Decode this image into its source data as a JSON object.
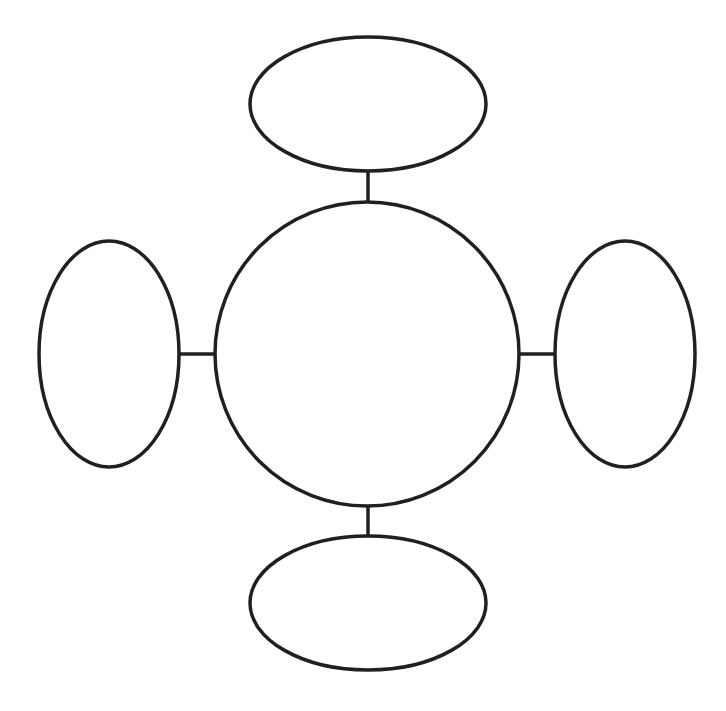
{
  "diagram": {
    "type": "bubble-map",
    "width": 726,
    "height": 711,
    "background": "#ffffff",
    "stroke_color": "#231f20",
    "stroke_width": 3.5,
    "center": {
      "label": "",
      "cx": 367,
      "cy": 354,
      "r": 152
    },
    "nodes": [
      {
        "id": "top",
        "label": "",
        "cx": 368,
        "cy": 104,
        "rx": 118,
        "ry": 67
      },
      {
        "id": "bottom",
        "label": "",
        "cx": 368,
        "cy": 603,
        "rx": 118,
        "ry": 67
      },
      {
        "id": "left",
        "label": "",
        "cx": 109,
        "cy": 354,
        "rx": 70,
        "ry": 113
      },
      {
        "id": "right",
        "label": "",
        "cx": 625,
        "cy": 354,
        "rx": 70,
        "ry": 113
      }
    ],
    "connectors": [
      {
        "id": "top",
        "x1": 368,
        "y1": 171,
        "x2": 368,
        "y2": 202
      },
      {
        "id": "bottom",
        "x1": 368,
        "y1": 506,
        "x2": 368,
        "y2": 536
      },
      {
        "id": "left",
        "x1": 179,
        "y1": 354,
        "x2": 215,
        "y2": 354
      },
      {
        "id": "right",
        "x1": 519,
        "y1": 354,
        "x2": 555,
        "y2": 354
      }
    ]
  }
}
